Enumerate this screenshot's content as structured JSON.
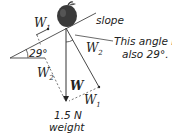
{
  "diagram": {
    "type": "force-vector-diagram",
    "object": "apple on slope",
    "labels": {
      "slope": "slope",
      "angle_note_line1": "This angle is",
      "angle_note_line2": "also 29°.",
      "angle": "29°",
      "w1_top": "W",
      "w1_top_sub": "1",
      "w2_right": "W",
      "w2_right_sub": "2",
      "w2_left": "W",
      "w2_left_sub": "2",
      "w1_bottom": "W",
      "w1_bottom_sub": "1",
      "weight_vector": "W",
      "weight_value": "1.5 N",
      "weight_caption": "weight"
    },
    "colors": {
      "line": "#333333",
      "apple": "#3a3a3a",
      "text": "#222222"
    }
  }
}
